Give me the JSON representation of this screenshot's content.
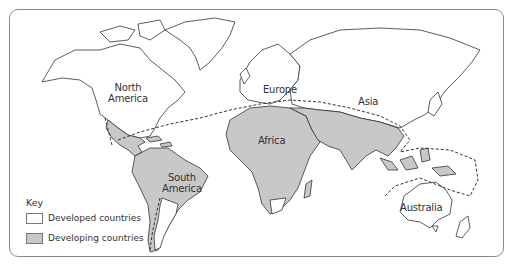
{
  "map": {
    "title": "World map: developed and developing countries",
    "colors": {
      "developed": "#ffffff",
      "developing": "#c8c8c8",
      "outline": "#333333",
      "boundary_line": "#333333",
      "frame": "#8a8a8a"
    },
    "regions": [
      {
        "name": "north-america",
        "label": "North\nAmerica",
        "status": "developed"
      },
      {
        "name": "europe",
        "label": "Europe",
        "status": "developed"
      },
      {
        "name": "asia",
        "label": "Asia",
        "status": "developed"
      },
      {
        "name": "africa",
        "label": "Africa",
        "status": "developing"
      },
      {
        "name": "south-america",
        "label": "South\nAmerica",
        "status": "developing"
      },
      {
        "name": "australia",
        "label": "Australia",
        "status": "developed"
      }
    ],
    "labels": {
      "north_america_1": "North",
      "north_america_2": "America",
      "europe": "Europe",
      "asia": "Asia",
      "africa": "Africa",
      "south_america_1": "South",
      "south_america_2": "America",
      "australia": "Australia"
    },
    "boundary": "Dashed line separating developed (north) and developing (south) countries"
  },
  "key": {
    "title": "Key",
    "items": [
      {
        "label": "Developed countries",
        "color": "#ffffff"
      },
      {
        "label": "Developing countries",
        "color": "#c8c8c8"
      }
    ]
  }
}
